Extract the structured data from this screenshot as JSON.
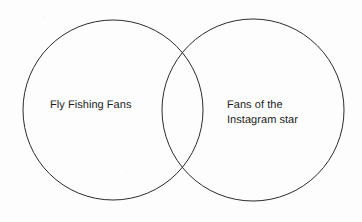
{
  "canvas": {
    "width": 362,
    "height": 222,
    "background_color": "#fdfdfd"
  },
  "diagram": {
    "type": "venn",
    "set_count": 2,
    "stroke_color": "#2b2b2b",
    "stroke_width": 1,
    "fill": "none",
    "circles": [
      {
        "name": "left-circle",
        "label": "Fly Fishing Fans",
        "cx": 113,
        "cy": 110,
        "r": 90
      },
      {
        "name": "right-circle",
        "label": "Fans of the Instagram star",
        "cx": 253,
        "cy": 110,
        "r": 91
      }
    ],
    "labels": {
      "left": {
        "text": "Fly Fishing Fans",
        "lines": [
          "Fly Fishing Fans"
        ],
        "x": 50,
        "y": 98,
        "color": "#1c1c1c",
        "font_size": 11
      },
      "right": {
        "text": "Fans of the Instagram star",
        "lines": [
          "Fans of the",
          "Instagram star"
        ],
        "x": 227,
        "y": 98,
        "color": "#1c1c1c",
        "font_size": 11
      }
    }
  }
}
